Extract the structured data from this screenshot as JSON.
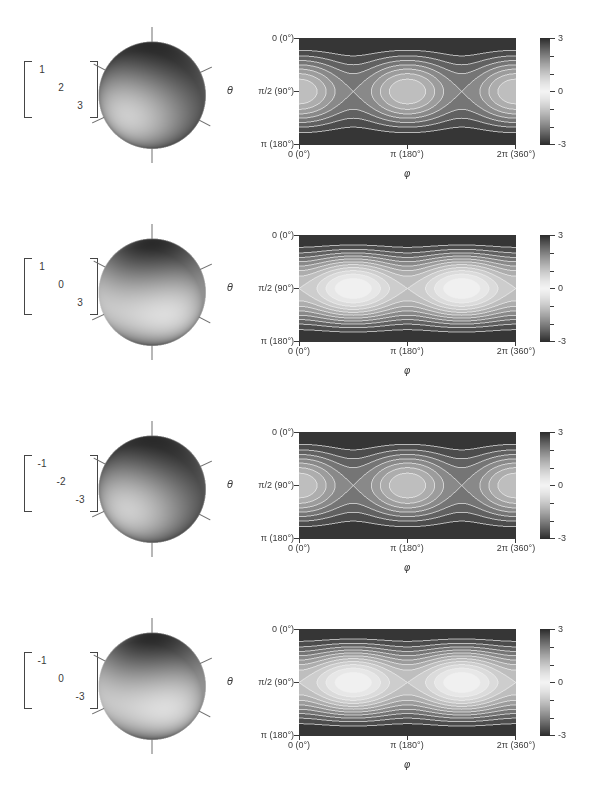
{
  "figure": {
    "rows": [
      {
        "matrix": [
          "1",
          "2",
          "3"
        ]
      },
      {
        "matrix": [
          "1",
          "0",
          "3"
        ]
      },
      {
        "matrix": [
          "-1",
          "-2",
          "-3"
        ]
      },
      {
        "matrix": [
          "-1",
          "0",
          "-3"
        ]
      }
    ],
    "axes": {
      "theta_label": "θ",
      "phi_label": "φ",
      "yticks": [
        "0 (0°)",
        "π/2 (90°)",
        "π (180°)"
      ],
      "xticks": [
        "0 (0°)",
        "π (180°)",
        "2π (360°)"
      ],
      "colorbar_ticks": [
        "3",
        "0",
        "-3"
      ]
    },
    "colors": {
      "background": "#ffffff",
      "cmap_light": "#f3f3f3",
      "cmap_dark": "#2b2b2b",
      "contour_line": "#f0f0f0",
      "axis_text": "#3a3a3a"
    }
  },
  "chart_data": [
    {
      "type": "heatmap",
      "subtype": "filled-contour",
      "matrix_diagonal": [
        1,
        2,
        3
      ],
      "formula": "z(θ,φ) = 1·sin²θ·cos²φ + 2·sin²θ·sin²φ + 3·cos²θ",
      "x": {
        "label": "φ",
        "min": 0,
        "max": 6.2832,
        "ticks": [
          {
            "value": 0,
            "label": "0 (0°)"
          },
          {
            "value": 3.1416,
            "label": "π (180°)"
          },
          {
            "value": 6.2832,
            "label": "2π (360°)"
          }
        ]
      },
      "y": {
        "label": "θ",
        "min": 0,
        "max": 3.1416,
        "ticks": [
          {
            "value": 0,
            "label": "0 (0°)"
          },
          {
            "value": 1.5708,
            "label": "π/2 (90°)"
          },
          {
            "value": 3.1416,
            "label": "π (180°)"
          }
        ]
      },
      "z": {
        "min": 1,
        "max": 3,
        "colorbar_range": [
          -3,
          3
        ],
        "colorbar_ticks": [
          3,
          0,
          -3
        ],
        "contour_step": 0.25
      },
      "features": "light elliptical lobes centered at θ=π/2 and φ=0, π, 2π; saddle points at φ=π/2, 3π/2; dark bands at θ=0 and θ=π"
    },
    {
      "type": "heatmap",
      "subtype": "filled-contour",
      "matrix_diagonal": [
        1,
        0,
        3
      ],
      "formula": "z(θ,φ) = 1·sin²θ·cos²φ + 0·sin²θ·sin²φ + 3·cos²θ",
      "x": {
        "label": "φ",
        "min": 0,
        "max": 6.2832,
        "ticks": [
          {
            "value": 0,
            "label": "0 (0°)"
          },
          {
            "value": 3.1416,
            "label": "π (180°)"
          },
          {
            "value": 6.2832,
            "label": "2π (360°)"
          }
        ]
      },
      "y": {
        "label": "θ",
        "min": 0,
        "max": 3.1416,
        "ticks": [
          {
            "value": 0,
            "label": "0 (0°)"
          },
          {
            "value": 1.5708,
            "label": "π/2 (90°)"
          },
          {
            "value": 3.1416,
            "label": "π (180°)"
          }
        ]
      },
      "z": {
        "min": 0,
        "max": 3,
        "colorbar_range": [
          -3,
          3
        ],
        "colorbar_ticks": [
          3,
          0,
          -3
        ],
        "contour_step": 0.25
      },
      "features": "near-white lobes centered at θ=π/2 and φ=π/2, 3π/2; saddle at φ=0, π, 2π; dark bands at θ=0 and θ=π"
    },
    {
      "type": "heatmap",
      "subtype": "filled-contour",
      "matrix_diagonal": [
        -1,
        -2,
        -3
      ],
      "formula": "z(θ,φ) = -1·sin²θ·cos²φ - 2·sin²θ·sin²φ - 3·cos²θ",
      "x": {
        "label": "φ",
        "min": 0,
        "max": 6.2832,
        "ticks": [
          {
            "value": 0,
            "label": "0 (0°)"
          },
          {
            "value": 3.1416,
            "label": "π (180°)"
          },
          {
            "value": 6.2832,
            "label": "2π (360°)"
          }
        ]
      },
      "y": {
        "label": "θ",
        "min": 0,
        "max": 3.1416,
        "ticks": [
          {
            "value": 0,
            "label": "0 (0°)"
          },
          {
            "value": 1.5708,
            "label": "π/2 (90°)"
          },
          {
            "value": 3.1416,
            "label": "π (180°)"
          }
        ]
      },
      "z": {
        "min": -3,
        "max": -1,
        "colorbar_range": [
          -3,
          3
        ],
        "colorbar_ticks": [
          3,
          0,
          -3
        ],
        "contour_step": 0.25
      },
      "features": "light elliptical lobes centered at θ=π/2 and φ=0, π, 2π; saddle points at φ=π/2, 3π/2; dark bands at θ=0 and θ=π"
    },
    {
      "type": "heatmap",
      "subtype": "filled-contour",
      "matrix_diagonal": [
        -1,
        0,
        -3
      ],
      "formula": "z(θ,φ) = -1·sin²θ·cos²φ + 0·sin²θ·sin²φ - 3·cos²θ",
      "x": {
        "label": "φ",
        "min": 0,
        "max": 6.2832,
        "ticks": [
          {
            "value": 0,
            "label": "0 (0°)"
          },
          {
            "value": 3.1416,
            "label": "π (180°)"
          },
          {
            "value": 6.2832,
            "label": "2π (360°)"
          }
        ]
      },
      "y": {
        "label": "θ",
        "min": 0,
        "max": 3.1416,
        "ticks": [
          {
            "value": 0,
            "label": "0 (0°)"
          },
          {
            "value": 1.5708,
            "label": "π/2 (90°)"
          },
          {
            "value": 3.1416,
            "label": "π (180°)"
          }
        ]
      },
      "z": {
        "min": -3,
        "max": 0,
        "colorbar_range": [
          -3,
          3
        ],
        "colorbar_ticks": [
          3,
          0,
          -3
        ],
        "contour_step": 0.25
      },
      "features": "near-white lobes centered at θ=π/2 and φ=π/2, 3π/2; saddle at φ=0, π, 2π; dark bands at θ=0 and θ=π"
    }
  ]
}
